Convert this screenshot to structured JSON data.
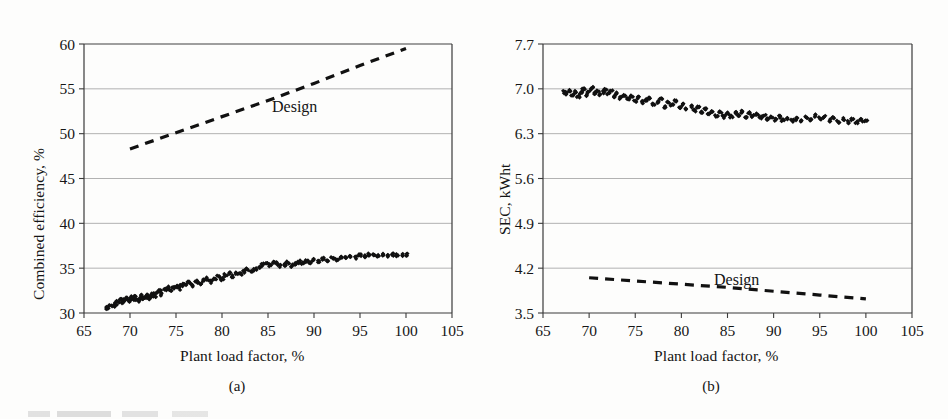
{
  "figure": {
    "background_color": "#fdfdfc",
    "ink_color": "#141414",
    "gridline_color": "#9a9a9a"
  },
  "panel_a": {
    "caption": "(a)",
    "xlabel": "Plant load factor, %",
    "ylabel": "Combined efficiency, %",
    "series_label": "Design",
    "xticks": [
      "65",
      "70",
      "75",
      "80",
      "85",
      "90",
      "95",
      "100",
      "105"
    ],
    "yticks": [
      "30",
      "35",
      "40",
      "45",
      "50",
      "55",
      "60"
    ]
  },
  "panel_b": {
    "caption": "(b)",
    "xlabel": "Plant load factor, %",
    "ylabel": "SEC, kWht",
    "series_label": "Design",
    "xticks": [
      "65",
      "70",
      "75",
      "80",
      "85",
      "90",
      "95",
      "100",
      "105"
    ],
    "yticks": [
      "3.5",
      "4.2",
      "4.9",
      "5.6",
      "6.3",
      "7.0",
      "7.7"
    ]
  },
  "chart_data": [
    {
      "type": "scatter",
      "panel": "(a)",
      "title": "",
      "xlabel": "Plant load factor, %",
      "ylabel": "Combined efficiency, %",
      "xlim": [
        65,
        105
      ],
      "ylim": [
        30,
        60
      ],
      "xticks": [
        65,
        70,
        75,
        80,
        85,
        90,
        95,
        100,
        105
      ],
      "yticks": [
        30,
        35,
        40,
        45,
        50,
        55,
        60
      ],
      "grid": "horizontal",
      "legend": "inline-annotation",
      "series": [
        {
          "name": "Measured",
          "type": "scatter",
          "marker": "filled-diamond",
          "color": "#111111",
          "x": [
            67.4,
            67.8,
            68.2,
            68.5,
            68.7,
            69.0,
            69.2,
            69.4,
            69.6,
            69.9,
            70.1,
            70.3,
            70.5,
            70.7,
            70.9,
            71.1,
            71.3,
            71.5,
            71.7,
            71.9,
            72.1,
            72.3,
            72.5,
            72.7,
            72.9,
            73.2,
            73.5,
            73.8,
            74.1,
            74.4,
            74.7,
            75.0,
            75.3,
            75.6,
            76.0,
            76.4,
            76.8,
            77.2,
            77.6,
            78.0,
            78.4,
            78.8,
            79.2,
            79.6,
            80.0,
            80.4,
            80.8,
            81.2,
            81.6,
            82.0,
            82.4,
            82.8,
            83.2,
            83.6,
            84.0,
            84.4,
            84.8,
            85.2,
            85.6,
            86.0,
            86.4,
            86.8,
            87.2,
            87.6,
            88.0,
            88.4,
            88.8,
            89.2,
            89.6,
            90.0,
            90.5,
            91.0,
            91.5,
            92.0,
            92.5,
            93.0,
            93.5,
            94.0,
            94.5,
            95.0,
            95.5,
            96.0,
            96.5,
            97.0,
            97.5,
            98.0,
            98.5,
            99.0,
            99.5,
            100.0
          ],
          "y": [
            30.6,
            30.7,
            30.8,
            31.0,
            31.3,
            31.5,
            31.2,
            31.4,
            31.6,
            31.3,
            31.7,
            31.5,
            31.8,
            31.6,
            31.4,
            31.7,
            31.9,
            31.6,
            31.8,
            32.0,
            31.7,
            31.9,
            32.1,
            31.8,
            32.2,
            32.4,
            32.1,
            32.6,
            32.8,
            32.5,
            32.9,
            33.0,
            32.7,
            33.1,
            33.2,
            33.4,
            33.1,
            33.5,
            33.3,
            33.6,
            33.8,
            33.5,
            33.9,
            34.1,
            33.8,
            34.2,
            34.4,
            34.1,
            34.5,
            34.3,
            34.6,
            34.8,
            34.5,
            34.9,
            35.1,
            35.4,
            35.6,
            35.3,
            35.7,
            35.5,
            35.2,
            35.4,
            35.6,
            35.3,
            35.5,
            35.7,
            35.5,
            35.8,
            35.6,
            35.9,
            35.8,
            36.0,
            35.9,
            36.1,
            36.0,
            36.2,
            36.1,
            36.3,
            36.2,
            36.4,
            36.3,
            36.5,
            36.4,
            36.3,
            36.5,
            36.4,
            36.5,
            36.4,
            36.5,
            36.5
          ]
        },
        {
          "name": "Design",
          "type": "line",
          "style": "dashed",
          "color": "#111111",
          "x": [
            70,
            75,
            80,
            85,
            90,
            95,
            100
          ],
          "y": [
            48.3,
            50.1,
            51.9,
            53.7,
            55.6,
            57.6,
            59.5
          ]
        }
      ]
    },
    {
      "type": "scatter",
      "panel": "(b)",
      "title": "",
      "xlabel": "Plant load factor, %",
      "ylabel": "SEC, kWht",
      "xlim": [
        65,
        105
      ],
      "ylim": [
        3.5,
        7.7
      ],
      "xticks": [
        65,
        70,
        75,
        80,
        85,
        90,
        95,
        100,
        105
      ],
      "yticks": [
        3.5,
        4.2,
        4.9,
        5.6,
        6.3,
        7.0,
        7.7
      ],
      "grid": "horizontal",
      "legend": "inline-annotation",
      "series": [
        {
          "name": "Measured",
          "type": "scatter",
          "marker": "filled-diamond",
          "color": "#111111",
          "x": [
            67.3,
            67.6,
            67.9,
            68.2,
            68.5,
            68.8,
            69.1,
            69.4,
            69.7,
            70.0,
            70.3,
            70.6,
            70.9,
            71.2,
            71.5,
            71.8,
            72.1,
            72.4,
            72.7,
            73.0,
            73.4,
            73.8,
            74.2,
            74.6,
            75.0,
            75.4,
            75.8,
            76.2,
            76.6,
            77.0,
            77.4,
            77.8,
            78.2,
            78.6,
            79.0,
            79.4,
            79.8,
            80.2,
            80.6,
            81.0,
            81.4,
            81.8,
            82.2,
            82.6,
            83.0,
            83.4,
            83.8,
            84.2,
            84.6,
            85.0,
            85.4,
            85.8,
            86.2,
            86.6,
            87.0,
            87.4,
            87.8,
            88.2,
            88.6,
            89.0,
            89.4,
            89.8,
            90.2,
            90.6,
            91.0,
            91.5,
            92.0,
            92.5,
            93.0,
            93.5,
            94.0,
            94.5,
            95.0,
            95.5,
            96.0,
            96.5,
            97.0,
            97.5,
            98.0,
            98.5,
            99.0,
            99.5,
            100.0
          ],
          "y": [
            6.95,
            6.93,
            6.97,
            6.91,
            6.96,
            6.88,
            6.94,
            6.99,
            6.9,
            6.96,
            7.01,
            6.93,
            6.98,
            6.91,
            6.95,
            7.0,
            6.92,
            6.97,
            6.88,
            6.93,
            6.86,
            6.9,
            6.84,
            6.88,
            6.81,
            6.86,
            6.79,
            6.83,
            6.86,
            6.76,
            6.8,
            6.84,
            6.72,
            6.78,
            6.74,
            6.82,
            6.7,
            6.76,
            6.68,
            6.73,
            6.66,
            6.71,
            6.63,
            6.68,
            6.61,
            6.66,
            6.58,
            6.63,
            6.56,
            6.62,
            6.57,
            6.63,
            6.58,
            6.64,
            6.56,
            6.62,
            6.57,
            6.6,
            6.55,
            6.58,
            6.53,
            6.57,
            6.52,
            6.56,
            6.51,
            6.54,
            6.5,
            6.53,
            6.49,
            6.55,
            6.52,
            6.58,
            6.54,
            6.57,
            6.51,
            6.55,
            6.49,
            6.53,
            6.48,
            6.52,
            6.47,
            6.51,
            6.49
          ]
        },
        {
          "name": "Design",
          "type": "line",
          "style": "dashed",
          "color": "#111111",
          "x": [
            70,
            75,
            80,
            85,
            90,
            95,
            100
          ],
          "y": [
            4.05,
            4.0,
            3.95,
            3.9,
            3.84,
            3.78,
            3.72
          ]
        }
      ]
    }
  ]
}
